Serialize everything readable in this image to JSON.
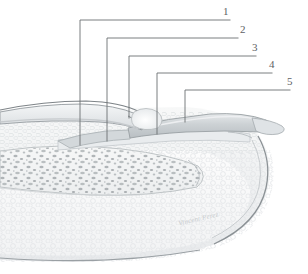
{
  "figure": {
    "type": "anatomical-illustration",
    "style": "grayscale medical line and wash drawing",
    "background_color": "#ffffff",
    "leader_color": "#6b6f72",
    "label_color": "#5d6164"
  },
  "labels": [
    {
      "id": "1",
      "text": "1"
    },
    {
      "id": "2",
      "text": "2"
    },
    {
      "id": "3",
      "text": "3"
    },
    {
      "id": "4",
      "text": "4"
    },
    {
      "id": "5",
      "text": "5"
    }
  ],
  "signature": {
    "text": "Vincent Perez"
  },
  "palette": {
    "outline": "#8d9296",
    "outline_dark": "#6e7478",
    "nail_plate": "#c7ccd0",
    "nail_plate_light": "#dfe3e6",
    "lunula": "#eef0f2",
    "bone_fill": "#f3f4f5",
    "trabecula": "#9aa0a4",
    "dermis": "#f0f1f2",
    "pulp": "#fafafa"
  }
}
